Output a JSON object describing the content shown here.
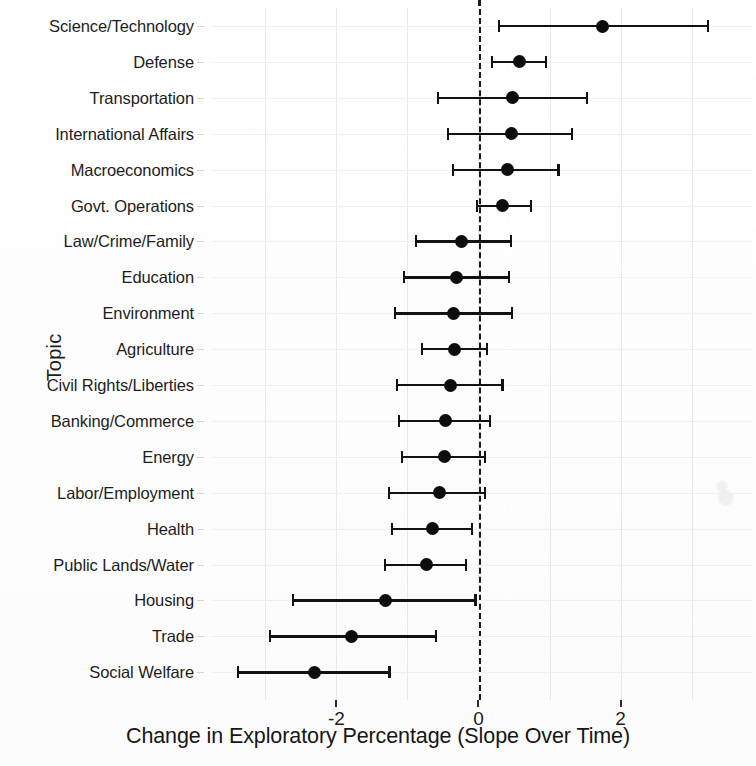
{
  "chart_data": {
    "type": "scatter",
    "title": "",
    "subtitle": "",
    "xlabel": "Change in Exploratory Percentage (Slope Over Time)",
    "ylabel": "Topic",
    "xlim": [
      -3.75,
      3.85
    ],
    "xticks": [
      -2,
      0,
      2
    ],
    "xtick_labels": [
      "-2",
      "0",
      "2"
    ],
    "grid": true,
    "legend": "none",
    "annotations": [
      {
        "type": "reference-line",
        "orientation": "vertical",
        "value": 0,
        "style": "dashed"
      }
    ],
    "categories": [
      "Science/Technology",
      "Defense",
      "Transportation",
      "International Affairs",
      "Macroeconomics",
      "Govt. Operations",
      "Law/Crime/Family",
      "Education",
      "Environment",
      "Agriculture",
      "Civil Rights/Liberties",
      "Banking/Commerce",
      "Energy",
      "Labor/Employment",
      "Health",
      "Public Lands/Water",
      "Housing",
      "Trade",
      "Social Welfare"
    ],
    "values": [
      1.75,
      0.58,
      0.48,
      0.47,
      0.41,
      0.34,
      -0.24,
      -0.31,
      -0.35,
      -0.34,
      -0.4,
      -0.47,
      -0.48,
      -0.55,
      -0.65,
      -0.73,
      -1.31,
      -1.78,
      -2.31
    ],
    "ci_low": [
      0.27,
      0.18,
      -0.58,
      -0.44,
      -0.37,
      -0.04,
      -0.9,
      -1.06,
      -1.19,
      -0.81,
      -1.16,
      -1.13,
      -1.09,
      -1.27,
      -1.23,
      -1.33,
      -2.63,
      -2.95,
      -3.4
    ],
    "ci_high": [
      3.24,
      0.96,
      1.54,
      1.33,
      1.14,
      0.75,
      0.47,
      0.44,
      0.48,
      0.13,
      0.35,
      0.18,
      0.11,
      0.11,
      -0.08,
      -0.16,
      -0.03,
      -0.59,
      -1.24
    ],
    "series": [
      {
        "name": "Slope estimate",
        "marker": "filled-circle",
        "errorbar": "95% CI"
      }
    ],
    "colors": {
      "point": "#0d0d0d",
      "interval": "#121212",
      "zero_line": "#1b1b1b",
      "grid": "#e9e9ec",
      "background": "#fdfdfd"
    }
  }
}
